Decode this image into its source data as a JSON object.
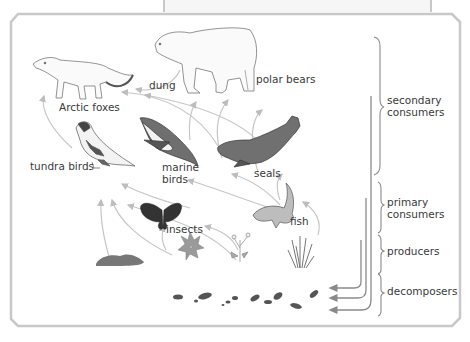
{
  "diagram": {
    "organisms": [
      {
        "id": "arctic-foxes",
        "label": "Arctic foxes"
      },
      {
        "id": "polar-bears",
        "label": "polar bears"
      },
      {
        "id": "dung",
        "label": "dung"
      },
      {
        "id": "tundra-birds",
        "label": "tundra birds"
      },
      {
        "id": "marine-birds",
        "label": "marine\nbirds"
      },
      {
        "id": "seals",
        "label": "seals"
      },
      {
        "id": "fish",
        "label": "fish"
      },
      {
        "id": "insects",
        "label": "insects"
      }
    ],
    "trophic_levels": [
      {
        "id": "secondary",
        "label": "secondary\nconsumers"
      },
      {
        "id": "primary",
        "label": "primary\nconsumers"
      },
      {
        "id": "producers",
        "label": "producers"
      },
      {
        "id": "decomposers",
        "label": "decomposers"
      }
    ],
    "colors": {
      "frame": "#c8c8c8",
      "arrow": "#bdbdbd",
      "return_arrow": "#8a8a8a",
      "text": "#3a3a3a",
      "dark_fill": "#555555"
    }
  }
}
